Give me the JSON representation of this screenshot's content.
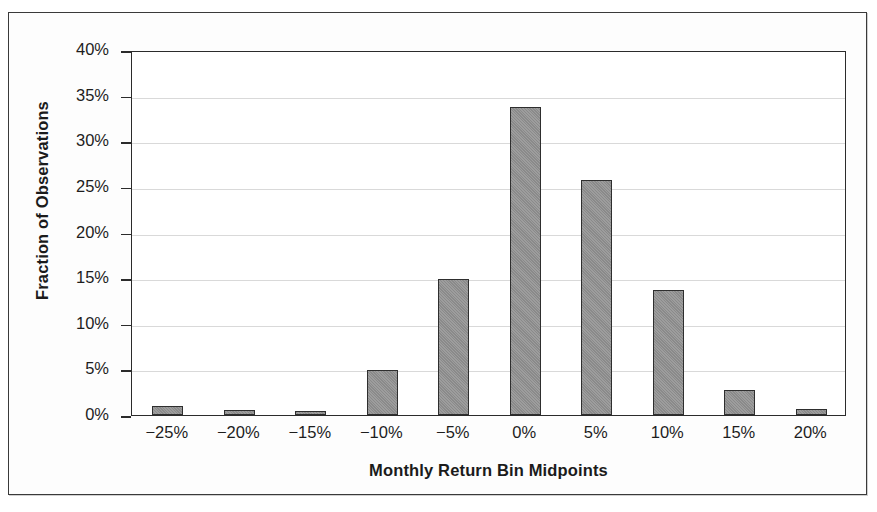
{
  "chart_data": {
    "type": "bar",
    "title": "",
    "xlabel": "Monthly Return Bin Midpoints",
    "ylabel": "Fraction of Observations",
    "categories": [
      "−25%",
      "−20%",
      "−15%",
      "−10%",
      "−5%",
      "0%",
      "5%",
      "10%",
      "15%",
      "20%"
    ],
    "values": [
      1.0,
      0.5,
      0.4,
      4.9,
      14.9,
      33.8,
      25.8,
      13.7,
      2.7,
      0.7
    ],
    "value_labels": [
      "1.0%",
      "0.5%",
      "0.4%",
      "4.9%",
      "14.9%",
      "33.8%",
      "25.8%",
      "13.7%",
      "2.7%",
      "0.7%"
    ],
    "ylim": [
      0,
      40
    ],
    "ytick_values": [
      0,
      5,
      10,
      15,
      20,
      25,
      30,
      35,
      40
    ],
    "ytick_labels": [
      "0%",
      "5%",
      "10%",
      "15%",
      "20%",
      "25%",
      "30%",
      "35%",
      "40%"
    ],
    "grid": true,
    "grid_axis": "y",
    "legend": null,
    "bar_color": "#8a8a8a",
    "bar_edge_color": "#2e2e2e",
    "gridline_color": "#d9d9d9",
    "axis_color": "#2b2b2b",
    "background_color": "#ffffff"
  }
}
